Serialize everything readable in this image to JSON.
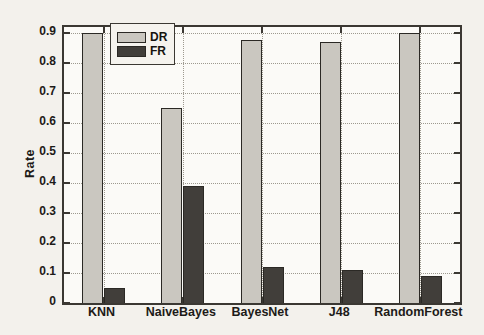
{
  "figure": {
    "ylabel": "Rate",
    "colors": {
      "paper_background": "#f3f1ec",
      "plot_background": "#fbfaf7",
      "axis_frame": "#3b3833",
      "gridline": "#9d998f",
      "text": "#1d1b18"
    }
  },
  "chart_data": {
    "type": "bar",
    "title": "",
    "xlabel": "",
    "ylabel": "Rate",
    "categories": [
      "KNN",
      "NaiveBayes",
      "BayesNet",
      "J48",
      "RandomForest"
    ],
    "series": [
      {
        "name": "DR",
        "color": "#cac7c0",
        "values": [
          0.9,
          0.65,
          0.875,
          0.87,
          0.9
        ]
      },
      {
        "name": "FR",
        "color": "#413e3a",
        "values": [
          0.05,
          0.39,
          0.12,
          0.11,
          0.09
        ]
      }
    ],
    "ylim": [
      0,
      0.92
    ],
    "yticks": [
      0,
      0.1,
      0.2,
      0.3,
      0.4,
      0.5,
      0.6,
      0.7,
      0.8,
      0.9
    ],
    "grid": true,
    "legend_position": "upper left inside"
  }
}
